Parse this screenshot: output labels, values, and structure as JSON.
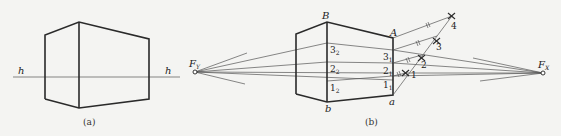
{
  "figure_a": {
    "caption": "(a)",
    "horizon_label_left": "h",
    "horizon_label_right": "h"
  },
  "figure_b": {
    "caption": "(b)",
    "vanishing_left": "F",
    "vanishing_left_sub": "Y",
    "vanishing_right": "F",
    "vanishing_right_sub": "X",
    "corner_B": "B",
    "corner_b": "b",
    "corner_A": "A",
    "corner_a": "a",
    "left_marks": [
      {
        "n": "3",
        "s": "2"
      },
      {
        "n": "2",
        "s": "2"
      },
      {
        "n": "1",
        "s": "2"
      }
    ],
    "right_marks": [
      {
        "n": "3",
        "s": "1"
      },
      {
        "n": "2",
        "s": "1"
      },
      {
        "n": "1",
        "s": "1"
      }
    ],
    "division_points": [
      "1",
      "2",
      "3",
      "4"
    ]
  }
}
